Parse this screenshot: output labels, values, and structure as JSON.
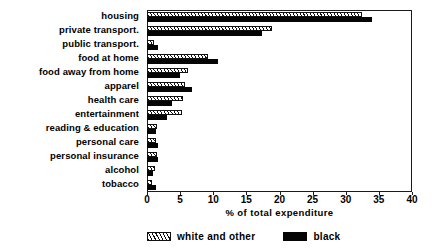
{
  "chart_data": {
    "type": "bar",
    "orientation": "horizontal",
    "title": "",
    "xlabel": "% of total expenditure",
    "ylabel": "",
    "xlim": [
      0,
      40
    ],
    "xticks": [
      0,
      5,
      10,
      15,
      20,
      25,
      30,
      35,
      40
    ],
    "grid": false,
    "legend_position": "bottom",
    "categories": [
      "housing",
      "private transport.",
      "public transport.",
      "food at home",
      "food away from home",
      "apparel",
      "health care",
      "entertainment",
      "reading & education",
      "personal care",
      "personal insurance",
      "alcohol",
      "tobacco"
    ],
    "series": [
      {
        "name": "white and other",
        "fill": "hatched",
        "color": "#ffffff",
        "values": [
          32.5,
          18.8,
          1.1,
          9.2,
          6.2,
          5.8,
          5.5,
          5.3,
          1.5,
          1.4,
          1.5,
          1.2,
          0.8
        ]
      },
      {
        "name": "black",
        "fill": "solid",
        "color": "#050505",
        "values": [
          34.0,
          17.4,
          1.6,
          10.7,
          5.0,
          6.8,
          3.8,
          3.0,
          1.3,
          1.7,
          1.6,
          0.9,
          1.3
        ]
      }
    ]
  },
  "legend": {
    "items": [
      {
        "label": "white and other",
        "swatch": "hatched-swatch"
      },
      {
        "label": "black",
        "swatch": "solid-black-swatch"
      }
    ]
  },
  "colors": {
    "axis": "#1a1a1a",
    "black_series": "#050505",
    "white_series": "#ffffff",
    "background": "#ffffff"
  }
}
